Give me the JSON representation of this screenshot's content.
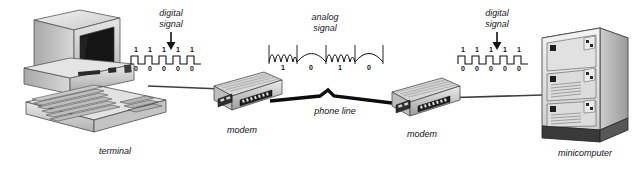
{
  "diagram": {
    "background_color": "#ffffff",
    "line_color": "#3a3a3a",
    "text_color": "#111111"
  },
  "signals": {
    "digital_left": {
      "label": "digital\nsignal",
      "type": "square-wave",
      "high_bits": [
        "1",
        "1",
        "1",
        "1",
        "1"
      ],
      "low_bits": [
        "0",
        "0",
        "0",
        "0",
        "0"
      ],
      "arrow": "down-arrow-icon"
    },
    "analog": {
      "label": "analog\nsignal",
      "type": "sine-wave",
      "bits": [
        "1",
        "0",
        "1",
        "0"
      ]
    },
    "digital_right": {
      "label": "digital\nsignal",
      "type": "square-wave",
      "high_bits": [
        "1",
        "1",
        "1",
        "1",
        "1"
      ],
      "low_bits": [
        "0",
        "0",
        "0",
        "0",
        "0"
      ],
      "arrow": "down-arrow-icon"
    }
  },
  "devices": {
    "terminal": {
      "label": "terminal",
      "icon": "crt-terminal-icon"
    },
    "modem_left": {
      "label": "modem",
      "icon": "modem-icon"
    },
    "modem_right": {
      "label": "modem",
      "icon": "modem-icon"
    },
    "minicomputer": {
      "label": "minicomputer",
      "icon": "minicomputer-cabinet-icon"
    }
  },
  "links": {
    "terminal_to_modem": {
      "label": "",
      "style": "solid"
    },
    "phone_line": {
      "label": "phone line",
      "style": "thick-solid"
    },
    "modem_to_minicomputer": {
      "label": "",
      "style": "solid"
    }
  }
}
